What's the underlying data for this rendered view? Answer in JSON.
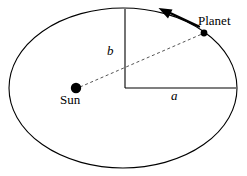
{
  "figure": {
    "background_color": "#ffffff",
    "stroke_color": "#000000",
    "width": 247,
    "height": 176,
    "labels": {
      "planet": "Planet",
      "sun": "Sun",
      "semi_major_axis": "a",
      "semi_minor_axis": "b"
    },
    "geometry": {
      "ellipse": {
        "center_x": 123,
        "center_y": 88,
        "radius_x": 114,
        "radius_y": 80,
        "stroke_width": 1.1
      },
      "sun_marker": {
        "cx": 76,
        "cy": 88,
        "r": 5.2,
        "fill": "#000000"
      },
      "planet_marker": {
        "cx": 204,
        "cy": 33,
        "r": 3.4,
        "fill": "#000000"
      },
      "semi_minor_line": {
        "x1": 125,
        "y1": 9,
        "x2": 125,
        "y2": 88,
        "stroke_width": 1.1
      },
      "semi_major_line": {
        "x1": 125,
        "y1": 88,
        "x2": 236,
        "y2": 88,
        "stroke_width": 1.1
      },
      "radius_vector": {
        "x1": 80,
        "y1": 87,
        "x2": 202,
        "y2": 34,
        "dash": "3,2.6",
        "stroke_width": 1.0
      },
      "velocity_arrow": {
        "tail_x": 198,
        "tail_y": 26,
        "head_x": 160,
        "head_y": 10,
        "stroke_width": 2.2,
        "head_size": 9
      }
    }
  }
}
